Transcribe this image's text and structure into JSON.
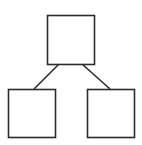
{
  "diagram": {
    "type": "tree",
    "stroke_color": "#2b2b2b",
    "fill_color": "#ffffff",
    "background": "#ffffff",
    "stroke_width": 1.6,
    "nodes": [
      {
        "id": "root",
        "x": 47.5,
        "y": 15.5,
        "w": 47,
        "h": 49
      },
      {
        "id": "left-child",
        "x": 8.5,
        "y": 89.5,
        "w": 47,
        "h": 48
      },
      {
        "id": "right-child",
        "x": 87.5,
        "y": 89.5,
        "w": 47,
        "h": 48
      }
    ],
    "edges": [
      {
        "from": "root",
        "to": "left-child",
        "x1": 59,
        "y1": 64,
        "x2": 34,
        "y2": 89
      },
      {
        "from": "root",
        "to": "right-child",
        "x1": 82,
        "y1": 64,
        "x2": 110,
        "y2": 89
      }
    ]
  }
}
